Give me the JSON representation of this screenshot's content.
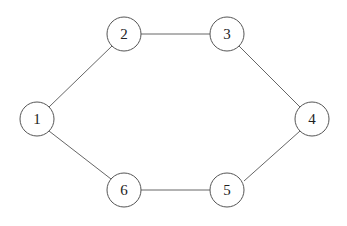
{
  "graph": {
    "nodes": [
      {
        "id": "1",
        "label": "1",
        "x": 37,
        "y": 119
      },
      {
        "id": "2",
        "label": "2",
        "x": 124,
        "y": 34
      },
      {
        "id": "3",
        "label": "3",
        "x": 227,
        "y": 34
      },
      {
        "id": "4",
        "label": "4",
        "x": 312,
        "y": 119
      },
      {
        "id": "5",
        "label": "5",
        "x": 227,
        "y": 190
      },
      {
        "id": "6",
        "label": "6",
        "x": 124,
        "y": 190
      }
    ],
    "edges": [
      {
        "from": "1",
        "to": "2"
      },
      {
        "from": "2",
        "to": "3"
      },
      {
        "from": "3",
        "to": "4"
      },
      {
        "from": "4",
        "to": "5"
      },
      {
        "from": "5",
        "to": "6"
      },
      {
        "from": "6",
        "to": "1"
      }
    ],
    "radius": 17
  }
}
